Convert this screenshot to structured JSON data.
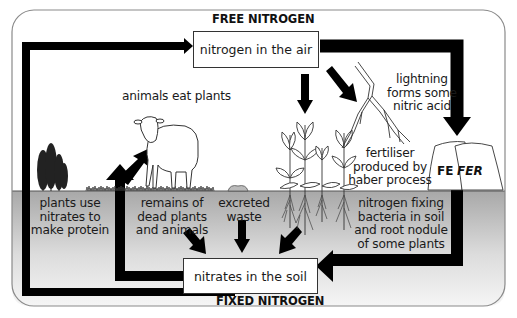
{
  "diagram": {
    "title_top": "FREE NITROGEN",
    "title_bottom": "FIXED NITROGEN",
    "nodes": {
      "air": "nitrogen in the air",
      "soil": "nitrates in the soil"
    },
    "labels": {
      "animals": "animals eat plants",
      "lightning": [
        "lightning",
        "forms some",
        "nitric acid"
      ],
      "fertiliser": [
        "fertiliser",
        "produced by",
        "haber process"
      ],
      "plants_use": [
        "plants use",
        "nitrates to",
        "make protein"
      ],
      "remains": [
        "remains of",
        "dead plants",
        "and animals"
      ],
      "excreted": [
        "excreted",
        "waste"
      ],
      "fixing": [
        "nitrogen fixing",
        "bacteria in soil",
        "and root nodule",
        "of some plants"
      ]
    },
    "bag_text": [
      "FE",
      "FER"
    ],
    "colors": {
      "arrow": "#000000",
      "soil_top": "#a9a9a9",
      "soil_bottom": "#f4f4f4",
      "frame": "#888888"
    }
  }
}
